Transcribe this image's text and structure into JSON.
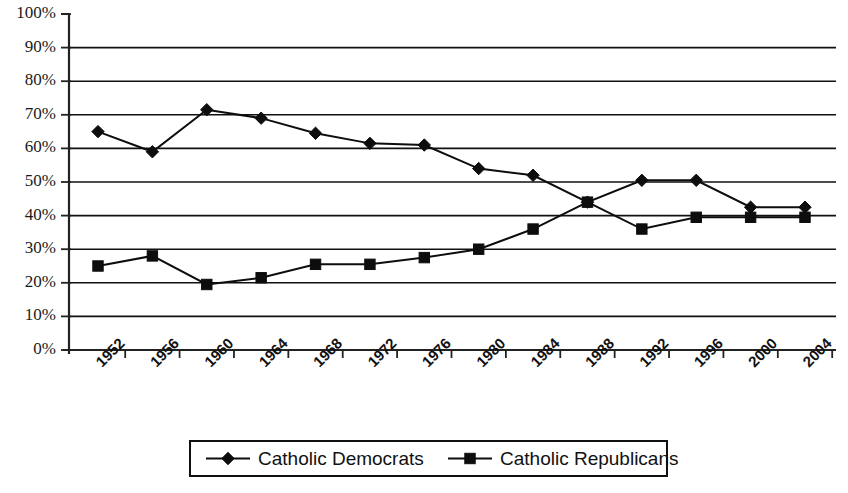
{
  "chart_data": {
    "type": "line",
    "title": "",
    "xlabel": "",
    "ylabel": "",
    "categories": [
      "1952",
      "1956",
      "1960",
      "1964",
      "1968",
      "1972",
      "1976",
      "1980",
      "1984",
      "1988",
      "1992",
      "1996",
      "2000",
      "2004"
    ],
    "x": [
      1952,
      1956,
      1960,
      1964,
      1968,
      1972,
      1976,
      1980,
      1984,
      1988,
      1992,
      1996,
      2000,
      2004
    ],
    "series": [
      {
        "name": "Catholic Democrats",
        "marker": "diamond",
        "values": [
          65,
          59,
          71.5,
          69,
          64.5,
          61.5,
          61,
          54,
          52,
          44,
          50.5,
          50.5,
          42.5,
          42.5
        ]
      },
      {
        "name": "Catholic Republicans",
        "marker": "square",
        "values": [
          25,
          28,
          19.5,
          21.5,
          25.5,
          25.5,
          27.5,
          30,
          36,
          44,
          36,
          39.5,
          39.5,
          39.5
        ]
      }
    ],
    "ylim": [
      0,
      100
    ],
    "ytick_labels": [
      "0%",
      "10%",
      "20%",
      "30%",
      "40%",
      "50%",
      "60%",
      "70%",
      "80%",
      "90%",
      "100%"
    ],
    "ytick_values": [
      0,
      10,
      20,
      30,
      40,
      50,
      60,
      70,
      80,
      90,
      100
    ],
    "grid": true,
    "grid_axis": "y",
    "legend_position": "bottom",
    "colors": {
      "line": "#0d0d0d",
      "grid": "#111111",
      "axis": "#222222",
      "background": "#ffffff"
    }
  },
  "legend": {
    "entries": [
      {
        "label": "Catholic Democrats",
        "marker": "diamond"
      },
      {
        "label": "Catholic Republicans",
        "marker": "square"
      }
    ]
  },
  "caption": {
    "text": ""
  }
}
